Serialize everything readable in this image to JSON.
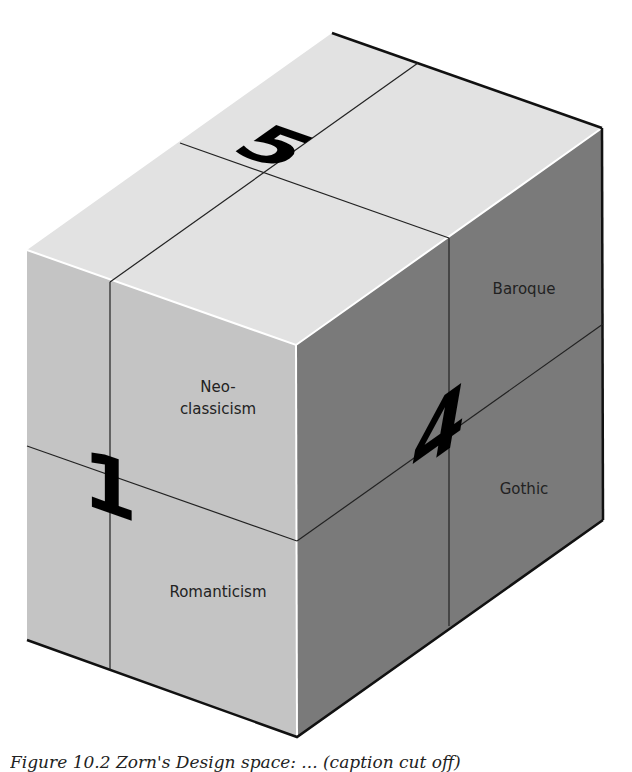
{
  "figure": {
    "type": "isometric-cube-diagram",
    "colors": {
      "top_face": "#e2e2e2",
      "left_face": "#c4c4c4",
      "right_face": "#7a7a7a",
      "edge": "#111111",
      "highlight": "#ffffff",
      "number": "#000000",
      "label_text": "#222222"
    },
    "faces": {
      "top": {
        "number": "5",
        "labels": []
      },
      "left": {
        "number": "1",
        "labels": [
          {
            "line1": "Neo-",
            "line2": "classicism"
          },
          {
            "line1": "Romanticism",
            "line2": ""
          }
        ]
      },
      "right": {
        "number": "4",
        "labels": [
          {
            "line1": "Baroque",
            "line2": ""
          },
          {
            "line1": "Gothic",
            "line2": ""
          }
        ]
      }
    }
  },
  "caption": {
    "text": "Figure 10.2 Zorn's Design space: ... (caption cut off)"
  }
}
